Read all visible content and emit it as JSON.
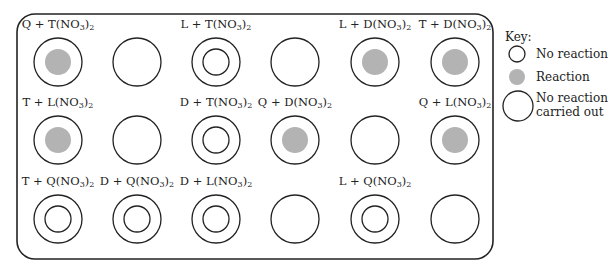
{
  "diagram": {
    "colors": {
      "stroke": "#222222",
      "reaction_fill": "#b3b3b3",
      "background": "#ffffff"
    },
    "grid": {
      "columns_x": [
        58,
        137,
        216,
        295,
        375,
        455
      ],
      "rows_y": [
        62,
        140,
        219
      ],
      "cells": [
        {
          "row": 0,
          "col": 0,
          "label": "Q + T(NO3)2",
          "state": "reaction"
        },
        {
          "row": 0,
          "col": 1,
          "label": "",
          "state": "not_carried_out"
        },
        {
          "row": 0,
          "col": 2,
          "label": "L + T(NO3)2",
          "state": "no_reaction"
        },
        {
          "row": 0,
          "col": 3,
          "label": "",
          "state": "not_carried_out"
        },
        {
          "row": 0,
          "col": 4,
          "label": "L + D(NO3)2",
          "state": "reaction"
        },
        {
          "row": 0,
          "col": 5,
          "label": "T + D(NO3)2",
          "state": "reaction"
        },
        {
          "row": 1,
          "col": 0,
          "label": "T + L(NO3)2",
          "state": "reaction"
        },
        {
          "row": 1,
          "col": 1,
          "label": "",
          "state": "not_carried_out"
        },
        {
          "row": 1,
          "col": 2,
          "label": "D + T(NO3)2",
          "state": "no_reaction"
        },
        {
          "row": 1,
          "col": 3,
          "label": "Q + D(NO3)2",
          "state": "reaction"
        },
        {
          "row": 1,
          "col": 4,
          "label": "",
          "state": "not_carried_out"
        },
        {
          "row": 1,
          "col": 5,
          "label": "Q + L(NO3)2",
          "state": "reaction"
        },
        {
          "row": 2,
          "col": 0,
          "label": "T + Q(NO3)2",
          "state": "no_reaction"
        },
        {
          "row": 2,
          "col": 1,
          "label": "D + Q(NO3)2",
          "state": "no_reaction"
        },
        {
          "row": 2,
          "col": 2,
          "label": "D + L(NO3)2",
          "state": "no_reaction"
        },
        {
          "row": 2,
          "col": 3,
          "label": "",
          "state": "not_carried_out"
        },
        {
          "row": 2,
          "col": 4,
          "label": "L + Q(NO3)2",
          "state": "no_reaction"
        },
        {
          "row": 2,
          "col": 5,
          "label": "",
          "state": "not_carried_out"
        }
      ]
    },
    "key": {
      "heading": "Key:",
      "items": [
        {
          "symbol": "small-ring",
          "label": "No reaction"
        },
        {
          "symbol": "gray-dot",
          "label": "Reaction"
        },
        {
          "symbol": "large-ring",
          "label": "No reaction carried out",
          "lines": [
            "No reaction",
            "carried out"
          ]
        }
      ]
    }
  }
}
